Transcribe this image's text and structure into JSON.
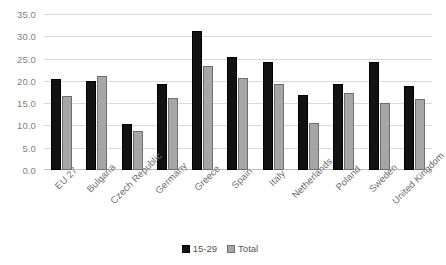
{
  "chart_data": {
    "type": "bar",
    "title": "",
    "xlabel": "",
    "ylabel": "",
    "ylim": [
      0,
      35
    ],
    "ytick_step": 5,
    "ytick_labels": [
      "0.0",
      "5.0",
      "10.0",
      "15.0",
      "20.0",
      "25.0",
      "30.0",
      "35.0"
    ],
    "grid": true,
    "legend_position": "bottom",
    "categories": [
      "EU 27",
      "Bulgaria",
      "Czech Republic",
      "Germany",
      "Greece",
      "Spain",
      "Italy",
      "Netherlands",
      "Poland",
      "Sweden",
      "United Kingdom"
    ],
    "series": [
      {
        "name": "15-29",
        "color": "#121212",
        "values": [
          20.5,
          19.9,
          10.3,
          19.3,
          31.2,
          25.4,
          24.2,
          16.9,
          19.2,
          24.3,
          18.8
        ]
      },
      {
        "name": "Total",
        "color": "#a6a6a6",
        "values": [
          16.7,
          21.0,
          8.8,
          16.2,
          23.3,
          20.7,
          19.2,
          10.5,
          17.2,
          15.0,
          16.0
        ]
      }
    ]
  }
}
